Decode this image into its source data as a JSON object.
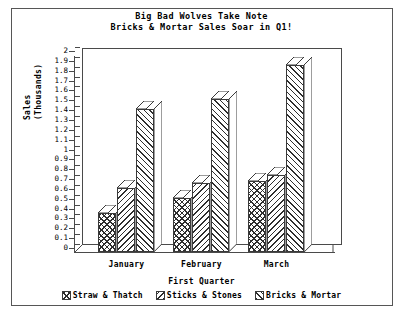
{
  "chart_data": {
    "type": "bar",
    "title": "Big Bad Wolves Take Note",
    "subtitle": "Bricks & Mortar Sales Soar in Q1!",
    "xlabel": "First Quarter",
    "ylabel": "Sales",
    "ylabel_line2": "(Thousands)",
    "categories": [
      "January",
      "February",
      "March"
    ],
    "series": [
      {
        "name": "Straw & Thatch",
        "values": [
          0.4,
          0.55,
          0.72
        ],
        "pattern": "cross"
      },
      {
        "name": "Sticks & Stones",
        "values": [
          0.65,
          0.7,
          0.78
        ],
        "pattern": "backslash"
      },
      {
        "name": "Bricks & Mortar",
        "values": [
          1.45,
          1.55,
          1.9
        ],
        "pattern": "slash"
      }
    ],
    "ylim": [
      0,
      2
    ],
    "ytick_step": 0.1,
    "ytick_labels": [
      "2",
      "1.9",
      "1.8",
      "1.7",
      "1.6",
      "1.5",
      "1.4",
      "1.3",
      "1.2",
      "1.1",
      "1",
      "0.9",
      "0.8",
      "0.7",
      "0.6",
      "0.5",
      "0.4",
      "0.3",
      "0.2",
      "0.1",
      "0"
    ],
    "grid": false,
    "legend_position": "bottom",
    "style": "3d-bar",
    "colors": {
      "background": "#ffffff",
      "frame": "#565656",
      "axis": "#4a4a4a",
      "hatch": "#2e2e2e",
      "text": "#000000"
    }
  }
}
